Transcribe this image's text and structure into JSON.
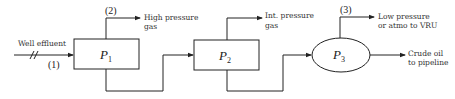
{
  "diagram": {
    "title": "",
    "input": {
      "label": "Well effluent",
      "stream_number": "(1)"
    },
    "processes": [
      {
        "id": "P1",
        "letter": "P",
        "subscript": "1",
        "shape": "rectangle"
      },
      {
        "id": "P2",
        "letter": "P",
        "subscript": "2",
        "shape": "rectangle"
      },
      {
        "id": "P3",
        "letter": "P",
        "subscript": "3",
        "shape": "ellipse"
      }
    ],
    "outputs": [
      {
        "from": "P1",
        "stream_number": "(2)",
        "label_line1": "High pressure",
        "label_line2": "gas"
      },
      {
        "from": "P2",
        "stream_number": "",
        "label_line1": "Int. pressure",
        "label_line2": "gas"
      },
      {
        "from": "P3",
        "stream_number": "(3)",
        "label_line1": "Low pressure",
        "label_line2": "or atmo to VRU"
      },
      {
        "from": "P3",
        "stream_number": "",
        "label_line1": "Crude oil",
        "label_line2": "to pipeline"
      }
    ],
    "connections": [
      {
        "from": "input",
        "to": "P1"
      },
      {
        "from": "P1",
        "to": "P2"
      },
      {
        "from": "P2",
        "to": "P3"
      }
    ]
  }
}
